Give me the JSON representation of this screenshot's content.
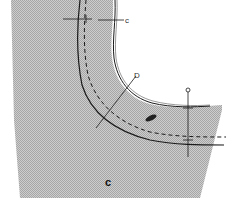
{
  "diagram": {
    "type": "sewing-pattern-detail",
    "colors": {
      "fabric_fill": "#c8c8c8",
      "fabric_pattern": "#a8a8a8",
      "background": "#ffffff",
      "line": "#1a1a1a"
    },
    "labels": {
      "top_marker": "c",
      "diagonal_marker": "D",
      "right_marker": "o",
      "piece_label": "c"
    },
    "lines": [
      {
        "name": "cut-edge",
        "style": "solid"
      },
      {
        "name": "seam-line",
        "style": "solid"
      },
      {
        "name": "stitching-line",
        "style": "dashed"
      }
    ],
    "markers": [
      {
        "name": "horizontal-notch-top",
        "label": "c"
      },
      {
        "name": "diagonal-notch",
        "label": "D"
      },
      {
        "name": "vertical-notch-right",
        "label": "o"
      }
    ]
  }
}
